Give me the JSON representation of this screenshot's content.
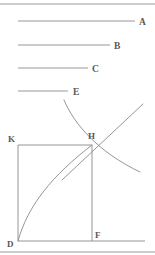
{
  "figure": {
    "caption_top_rule": "",
    "caption_bottom_rule": "",
    "segments": [
      {
        "label": "A",
        "x1": 18,
        "x2": 135,
        "y": 21,
        "label_x": 139,
        "label_y": 24.5
      },
      {
        "label": "B",
        "x1": 18,
        "x2": 110,
        "y": 45,
        "label_x": 114,
        "label_y": 48.5
      },
      {
        "label": "C",
        "x1": 18,
        "x2": 88,
        "y": 68,
        "label_x": 92,
        "label_y": 71.5
      },
      {
        "label": "E",
        "x1": 18,
        "x2": 68,
        "y": 91,
        "label_x": 73,
        "label_y": 94.5
      }
    ],
    "points": [
      {
        "name": "K",
        "label": "K",
        "x": 18,
        "y": 145,
        "label_x": 8,
        "label_y": 142
      },
      {
        "name": "H",
        "label": "H",
        "x": 92,
        "y": 145,
        "label_x": 88,
        "label_y": 139
      },
      {
        "name": "D",
        "label": "D",
        "x": 18,
        "y": 241,
        "label_x": 7,
        "label_y": 247
      },
      {
        "name": "F",
        "label": "F",
        "x": 92,
        "y": 241,
        "label_x": 95,
        "label_y": 238
      }
    ],
    "rules": [
      {
        "name": "top-rule",
        "x1": 0,
        "x2": 155,
        "y": 4
      },
      {
        "name": "bottom-rule",
        "x1": 0,
        "x2": 155,
        "y": 252
      }
    ],
    "construction": {
      "baseline": {
        "x1": 18,
        "x2": 145,
        "y": 241
      },
      "left_side": {
        "x1": 18,
        "y1": 145,
        "x2": 18,
        "y2": 241
      },
      "top_side": {
        "x1": 18,
        "y1": 145,
        "x2": 92,
        "y2": 145
      },
      "ordinate": {
        "x1": 92,
        "y1": 145,
        "x2": 92,
        "y2": 241
      },
      "rising_curve_path": "M 18 241 C 28 205 52 176 92 145",
      "descending_curve_path": "M 64 100 C 74 124 98 152 140 172",
      "rising_line_path": "M 62 180 L 143 104"
    },
    "colors": {
      "ink": "#8a8a8a",
      "label_ink": "#585858",
      "rule": "#9a9a9a",
      "background": "#ffffff"
    }
  }
}
